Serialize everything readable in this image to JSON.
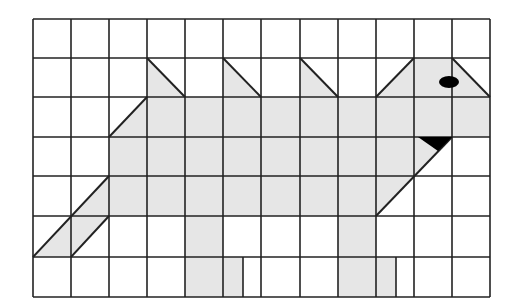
{
  "figure": {
    "grid": {
      "cols": 12,
      "rows": 7,
      "x_lines": [
        33,
        71,
        109,
        147,
        185,
        223,
        261,
        300,
        338,
        376,
        414,
        452,
        490
      ],
      "y_lines": [
        19,
        58,
        97,
        137,
        176,
        216,
        257,
        297
      ],
      "line_color": "#222222",
      "line_width": 1.6
    },
    "colors": {
      "fill": "#e6e6e6",
      "outline": "#222222",
      "eye": "#000000",
      "beak": "#000000",
      "background": "#ffffff"
    },
    "shapes": {
      "body": [
        [
          109,
          137
        ],
        [
          147,
          97
        ],
        [
          490,
          97
        ],
        [
          490,
          137
        ],
        [
          452,
          137
        ],
        [
          376,
          216
        ],
        [
          376,
          257
        ],
        [
          376,
          297
        ],
        [
          338,
          297
        ],
        [
          338,
          216
        ],
        [
          223,
          216
        ],
        [
          223,
          257
        ],
        [
          243,
          257
        ],
        [
          243,
          297
        ],
        [
          185,
          297
        ],
        [
          185,
          216
        ],
        [
          109,
          216
        ],
        [
          109,
          176
        ]
      ],
      "spike_1": [
        [
          147,
          58
        ],
        [
          185,
          97
        ],
        [
          147,
          97
        ]
      ],
      "spike_2": [
        [
          223,
          58
        ],
        [
          261,
          97
        ],
        [
          223,
          97
        ]
      ],
      "spike_3": [
        [
          300,
          58
        ],
        [
          338,
          97
        ],
        [
          300,
          97
        ]
      ],
      "head": [
        [
          376,
          97
        ],
        [
          414,
          58
        ],
        [
          452,
          58
        ],
        [
          490,
          97
        ]
      ],
      "tail": [
        [
          109,
          176
        ],
        [
          109,
          216
        ],
        [
          71,
          257
        ],
        [
          33,
          257
        ]
      ],
      "leg_front_foot": [
        [
          338,
          257
        ],
        [
          396,
          257
        ],
        [
          396,
          297
        ],
        [
          338,
          297
        ]
      ],
      "leg_back_foot": [
        [
          185,
          257
        ],
        [
          243,
          257
        ],
        [
          243,
          297
        ],
        [
          185,
          297
        ]
      ]
    },
    "eye": {
      "cx": 449,
      "cy": 82,
      "rx": 10,
      "ry": 6
    },
    "beak": [
      [
        418,
        137
      ],
      [
        452,
        137
      ],
      [
        438,
        151
      ]
    ]
  }
}
